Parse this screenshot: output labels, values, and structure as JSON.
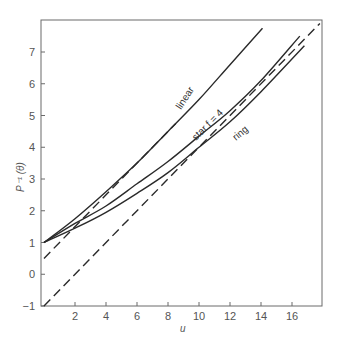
{
  "chart_data": {
    "type": "line",
    "title": "",
    "xlabel": "u",
    "ylabel": "P⁻¹ (θ)",
    "xlim": [
      0,
      18
    ],
    "ylim": [
      -1,
      8
    ],
    "grid": false,
    "legend": "inline labels on curves",
    "x_ticks": [
      2,
      4,
      6,
      8,
      10,
      12,
      14,
      16
    ],
    "y_ticks": [
      -1,
      0,
      1,
      2,
      3,
      4,
      5,
      6,
      7
    ],
    "series": [
      {
        "name": "linear",
        "style": "solid",
        "x": [
          0,
          2,
          4,
          6,
          8,
          10,
          12,
          14.1
        ],
        "y": [
          1,
          1.75,
          2.6,
          3.5,
          4.5,
          5.5,
          6.6,
          7.75
        ]
      },
      {
        "name": "star f = 4",
        "style": "solid",
        "x": [
          0,
          2,
          4,
          6,
          8,
          10,
          12,
          14,
          16.5
        ],
        "y": [
          1,
          1.6,
          2.15,
          2.85,
          3.55,
          4.35,
          5.15,
          6.1,
          7.5
        ]
      },
      {
        "name": "ring",
        "style": "solid",
        "x": [
          0,
          2,
          4,
          6,
          8,
          10,
          12,
          14,
          16.8
        ],
        "y": [
          1,
          1.45,
          1.95,
          2.55,
          3.2,
          4.0,
          4.8,
          5.75,
          7.2
        ]
      },
      {
        "name": "asymptote (0.5 + u/2)",
        "style": "dashed",
        "x": [
          0,
          8.5
        ],
        "y": [
          0.5,
          4.75
        ]
      },
      {
        "name": "asymptote (-1 + u/2)",
        "style": "dashed",
        "x": [
          0,
          17.8
        ],
        "y": [
          -1,
          7.9
        ]
      }
    ],
    "annotations": [
      "linear",
      "star f = 4",
      "ring"
    ]
  },
  "labels": {
    "xlabel": "u",
    "ylabel": "P⁻¹ (θ)",
    "linear": "linear",
    "star": "star f = 4",
    "ring": "ring"
  }
}
